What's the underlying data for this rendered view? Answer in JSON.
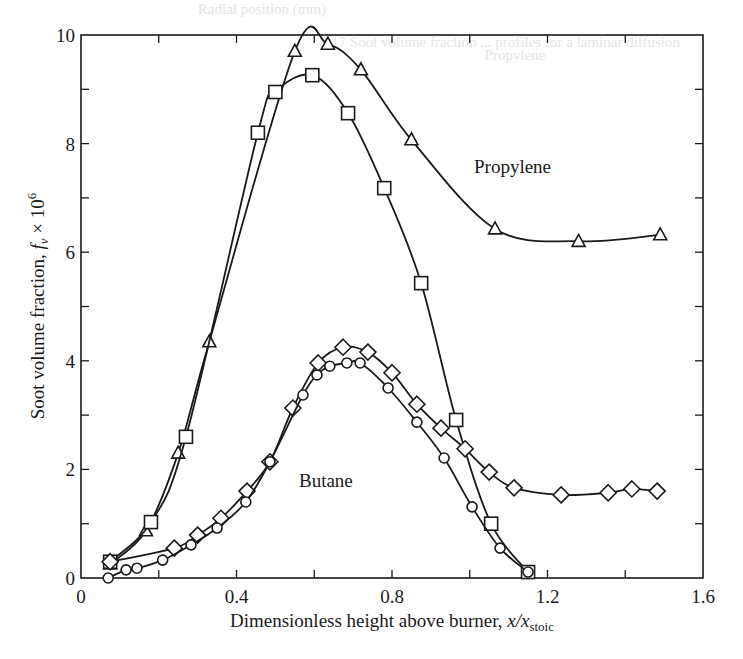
{
  "chart_data": {
    "type": "line",
    "title": "",
    "xlabel": "Dimensionless height above burner, x/x_stoic",
    "xlabel_main": "Dimensionless height above burner, ",
    "xlabel_var": "x/x",
    "xlabel_sub": "stoic",
    "ylabel": "Soot volume fraction, f_v × 10^6",
    "ylabel_main": "Soot volume fraction, ",
    "ylabel_var": "f",
    "ylabel_sub": "v",
    "ylabel_suffix": " × 10",
    "ylabel_sup": "6",
    "xlim": [
      0,
      1.6
    ],
    "ylim": [
      0,
      10
    ],
    "x_ticks": [
      0,
      0.2,
      0.4,
      0.6,
      0.8,
      1.0,
      1.2,
      1.4,
      1.6
    ],
    "x_tick_labels": [
      "0",
      "0.4",
      "0.8",
      "1.2",
      "1.6"
    ],
    "x_tick_label_values": [
      0,
      0.4,
      0.8,
      1.2,
      1.6
    ],
    "y_ticks": [
      0,
      1,
      2,
      3,
      4,
      5,
      6,
      7,
      8,
      9,
      10
    ],
    "y_tick_labels": [
      "0",
      "2",
      "4",
      "6",
      "8",
      "10"
    ],
    "y_tick_label_values": [
      0,
      2,
      4,
      6,
      8,
      10
    ],
    "grid": false,
    "legend": "none",
    "annotations": [
      {
        "text": "Propylene",
        "x": 1.11,
        "y": 7.45
      },
      {
        "text": "Butane",
        "x": 0.63,
        "y": 1.68
      }
    ],
    "series": [
      {
        "name": "Propylene (triangles)",
        "marker": "triangle",
        "x": [
          0.075,
          0.167,
          0.25,
          0.33,
          0.55,
          0.635,
          0.72,
          0.85,
          1.065,
          1.28,
          1.49
        ],
        "y": [
          0.26,
          0.87,
          2.3,
          4.35,
          9.7,
          9.83,
          9.36,
          8.07,
          6.43,
          6.2,
          6.32
        ]
      },
      {
        "name": "Propylene (squares)",
        "marker": "square",
        "x": [
          0.075,
          0.18,
          0.27,
          0.455,
          0.5,
          0.595,
          0.687,
          0.78,
          0.875,
          0.965,
          1.055,
          1.15
        ],
        "y": [
          0.3,
          1.03,
          2.6,
          8.2,
          8.95,
          9.26,
          8.56,
          7.18,
          5.43,
          2.91,
          1.0,
          0.11
        ]
      },
      {
        "name": "Butane (diamonds)",
        "marker": "diamond",
        "x": [
          0.075,
          0.24,
          0.3,
          0.36,
          0.427,
          0.486,
          0.545,
          0.61,
          0.674,
          0.738,
          0.8,
          0.864,
          0.926,
          0.988,
          1.05,
          1.114,
          1.235,
          1.356,
          1.417,
          1.482
        ],
        "y": [
          0.3,
          0.55,
          0.79,
          1.1,
          1.6,
          2.14,
          3.13,
          3.96,
          4.25,
          4.16,
          3.78,
          3.2,
          2.76,
          2.38,
          1.95,
          1.66,
          1.53,
          1.57,
          1.64,
          1.6
        ]
      },
      {
        "name": "Butane (circles)",
        "marker": "circle",
        "x": [
          0.07,
          0.116,
          0.144,
          0.21,
          0.283,
          0.35,
          0.424,
          0.486,
          0.571,
          0.607,
          0.64,
          0.684,
          0.718,
          0.79,
          0.864,
          0.934,
          1.006,
          1.078,
          1.15
        ],
        "y": [
          0.0,
          0.15,
          0.18,
          0.33,
          0.61,
          0.92,
          1.4,
          2.14,
          3.37,
          3.74,
          3.9,
          3.96,
          3.96,
          3.5,
          2.87,
          2.21,
          1.31,
          0.55,
          0.11
        ]
      }
    ]
  },
  "colors": {
    "ink": "#1a1a1a",
    "background": "#ffffff",
    "bleed_through": "#e4e4e4"
  },
  "bleed_through_text": [
    {
      "text": "Radial position (mm)",
      "x": 262,
      "y": 14
    },
    {
      "text": "9.17     Soot volume fraction ... profiles for a laminar diffusion",
      "x": 500,
      "y": 47
    },
    {
      "text": "Propylene",
      "x": 515,
      "y": 60
    }
  ]
}
